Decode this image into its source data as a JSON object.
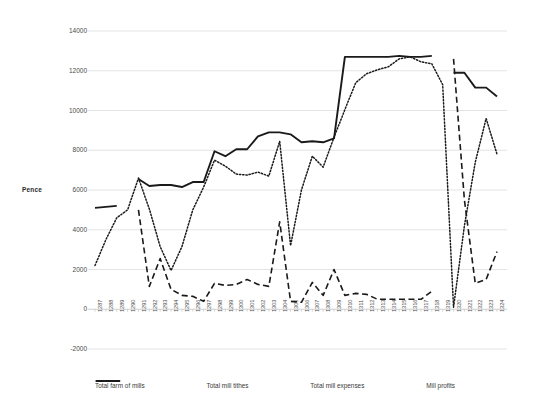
{
  "chart_data": {
    "type": "line",
    "title": "",
    "xlabel": "",
    "ylabel": "Pence",
    "ylim": [
      -2000,
      14000
    ],
    "ytick_labels": [
      "14000",
      "12000",
      "10000",
      "8000",
      "6000",
      "4000",
      "2000",
      "0",
      "-2000"
    ],
    "ytick_values": [
      14000,
      12000,
      10000,
      8000,
      6000,
      4000,
      2000,
      0,
      -2000
    ],
    "grid": true,
    "legend_position": "bottom",
    "categories": [
      "1287",
      "1288",
      "1289",
      "1290",
      "1291",
      "1292",
      "1293",
      "1294",
      "1295",
      "1296",
      "1297",
      "1298",
      "1299",
      "1300",
      "1301",
      "1302",
      "1303",
      "1304",
      "1305",
      "1306",
      "1307",
      "1308",
      "1309",
      "1310",
      "1311",
      "1312",
      "1313",
      "1314",
      "1315",
      "1316",
      "1317",
      "1318",
      "1319",
      "1320",
      "1321",
      "1322",
      "1323",
      "1324"
    ],
    "series": [
      {
        "name": "Total farm of mills",
        "style": "solid",
        "values": [
          5100,
          5150,
          5200,
          null,
          6550,
          6200,
          6250,
          6250,
          6150,
          6400,
          6400,
          7950,
          7700,
          8050,
          8050,
          8700,
          8900,
          8900,
          8800,
          8400,
          8450,
          8400,
          8600,
          12700,
          12700,
          12700,
          12700,
          12700,
          12750,
          12700,
          12700,
          12750,
          null,
          11900,
          11900,
          11150,
          11150,
          10700
        ]
      },
      {
        "name": "Total mill tithes",
        "style": "dashed",
        "values": [
          null,
          null,
          null,
          null,
          5000,
          1150,
          2550,
          1000,
          700,
          650,
          400,
          1300,
          1200,
          1250,
          1500,
          1250,
          1150,
          4400,
          400,
          350,
          1350,
          700,
          2000,
          700,
          800,
          750,
          500,
          500,
          500,
          500,
          500,
          900,
          null,
          12600,
          5500,
          1300,
          1500,
          2900
        ]
      },
      {
        "name": "Total mill expenses",
        "style": "dash-dot",
        "values": [
          null,
          null,
          null,
          null,
          null,
          null,
          null,
          null,
          null,
          null,
          null,
          null,
          null,
          null,
          null,
          null,
          null,
          null,
          null,
          null,
          null,
          null,
          null,
          null,
          null,
          null,
          null,
          null,
          null,
          null,
          null,
          null,
          null,
          null,
          null,
          null,
          null,
          null
        ]
      },
      {
        "name": "Mill profits",
        "style": "dotted",
        "values": [
          2200,
          3500,
          4600,
          5000,
          6600,
          5050,
          3150,
          1950,
          3150,
          5000,
          6150,
          7500,
          7200,
          6800,
          6750,
          6900,
          6700,
          8450,
          3200,
          6000,
          7700,
          7150,
          8650,
          10050,
          11400,
          11850,
          12050,
          12200,
          12600,
          12700,
          12450,
          12350,
          11300,
          100,
          4200,
          7400,
          9600,
          7800
        ]
      }
    ]
  },
  "legend": {
    "items": [
      {
        "label": "Total farm of mills",
        "style": "solid"
      },
      {
        "label": "Total mill tithes",
        "style": "dashed"
      },
      {
        "label": "Total mill expenses",
        "style": "dash-dot"
      },
      {
        "label": "Mill profits",
        "style": "dotted"
      }
    ]
  }
}
